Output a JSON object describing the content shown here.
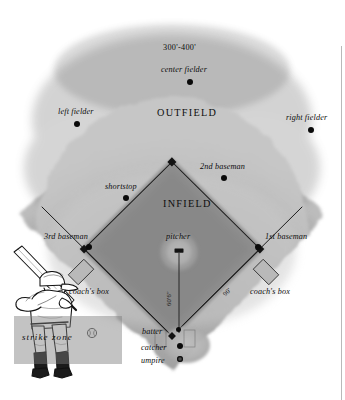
{
  "diagram": {
    "regions": [
      {
        "name": "outfield",
        "label": "OUTFIELD"
      },
      {
        "name": "infield",
        "label": "INFIELD"
      }
    ],
    "dimensions": [
      {
        "name": "outfield-depth",
        "label": "300'-400'"
      },
      {
        "name": "pitching-distance",
        "label": "60'6\""
      },
      {
        "name": "base-path",
        "label": "90'"
      }
    ],
    "positions": [
      {
        "name": "left-fielder",
        "label": "left fielder"
      },
      {
        "name": "center-fielder",
        "label": "center fielder"
      },
      {
        "name": "right-fielder",
        "label": "right fielder"
      },
      {
        "name": "shortstop",
        "label": "shortstop"
      },
      {
        "name": "second-baseman",
        "label": "2nd baseman"
      },
      {
        "name": "third-baseman",
        "label": "3rd baseman"
      },
      {
        "name": "first-baseman",
        "label": "1st baseman"
      },
      {
        "name": "pitcher",
        "label": "pitcher"
      },
      {
        "name": "batter",
        "label": "batter"
      },
      {
        "name": "catcher",
        "label": "catcher"
      },
      {
        "name": "umpire",
        "label": "umpire"
      }
    ],
    "coach_box_left": "coach's box",
    "coach_box_right": "coach's box",
    "strike_zone": "strike zone",
    "colors": {
      "grass_outfield": "#9b9b9b",
      "grass_infield": "#b4b4b4",
      "dirt_infield": "#8e8e8e",
      "foul_line": "#1a1a1a",
      "label_text": "#0d0d0d",
      "strike_zone_fill": "#7d7d7d",
      "background": "#ffffff"
    }
  }
}
